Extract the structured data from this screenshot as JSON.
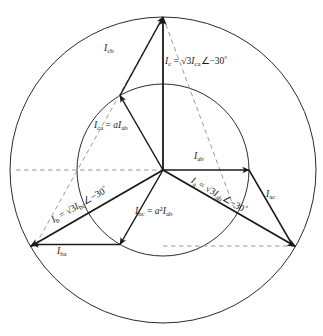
{
  "figure": {
    "kind": "phasor-diagram",
    "title": "",
    "center": {
      "x": 163,
      "y": 170
    },
    "circles": [
      {
        "name": "inner-circle",
        "radius": 86,
        "style": "solid"
      },
      {
        "name": "outer-circle",
        "radius": 153,
        "style": "solid"
      }
    ],
    "colors": {
      "stroke": "#1a1a1a",
      "dashed": "#8a8a8a",
      "background": "#ffffff"
    }
  },
  "phasors": {
    "delta_currents": [
      {
        "name": "I-ab",
        "label_parts": {
          "sym": "I",
          "sub": "ab"
        },
        "angle_deg": 0,
        "magnitude": 86
      },
      {
        "name": "I-bc",
        "label_parts": {
          "sym": "I",
          "sub": "bc"
        },
        "angle_deg": -120,
        "magnitude": 86
      },
      {
        "name": "I-ca",
        "label_parts": {
          "sym": "I",
          "sub": "ca"
        },
        "angle_deg": 120,
        "magnitude": 86
      }
    ],
    "line_currents": [
      {
        "name": "I-a",
        "label_parts": {
          "sym": "I",
          "sub": "a"
        },
        "angle_deg": -30,
        "magnitude": 153
      },
      {
        "name": "I-b",
        "label_parts": {
          "sym": "I",
          "sub": "b"
        },
        "angle_deg": -150,
        "magnitude": 153
      },
      {
        "name": "I-c",
        "label_parts": {
          "sym": "I",
          "sub": "c"
        },
        "angle_deg": 90,
        "magnitude": 153
      }
    ],
    "shifted_currents": [
      {
        "name": "I-ac",
        "label_parts": {
          "sym": "I",
          "sub": "ac"
        }
      },
      {
        "name": "I-ba",
        "label_parts": {
          "sym": "I",
          "sub": "ba"
        }
      },
      {
        "name": "I-cb",
        "label_parts": {
          "sym": "I",
          "sub": "cb"
        }
      }
    ]
  },
  "labels": {
    "i_cb": {
      "sym": "I",
      "sub": "cb"
    },
    "i_ac": {
      "sym": "I",
      "sub": "ac"
    },
    "i_ba": {
      "sym": "I",
      "sub": "ba"
    },
    "i_ab": {
      "sym": "I",
      "sub": "ab"
    },
    "i_c_eq": {
      "lhs_sym": "I",
      "lhs_sub": "c",
      "eq": "=",
      "radical": "√3",
      "rhs_sym": "I",
      "rhs_sub": "ca",
      "angle_mark": "∠",
      "angle_value": "−30",
      "deg": "°"
    },
    "i_a_eq": {
      "lhs_sym": "I",
      "lhs_sub": "a",
      "eq": "=",
      "radical": "√3",
      "rhs_sym": "I",
      "rhs_sub": "ab",
      "angle_mark": "∠",
      "angle_value": "−30",
      "deg": "°"
    },
    "i_b_eq": {
      "lhs_sym": "I",
      "lhs_sub": "b",
      "eq": "=",
      "radical": "√3",
      "rhs_sym": "I",
      "rhs_sub": "bc",
      "angle_mark": "∠",
      "angle_value": "−30",
      "deg": "°"
    },
    "i_ca_eq": {
      "lhs_sym": "I",
      "lhs_sub": "ca",
      "eq": "=",
      "coef": "a",
      "rhs_sym": "I",
      "rhs_sub": "ab"
    },
    "i_bc_eq": {
      "lhs_sym": "I",
      "lhs_sub": "bc",
      "eq": "=",
      "coef": "a",
      "coef_exp": "2",
      "rhs_sym": "I",
      "rhs_sub": "ab"
    }
  }
}
